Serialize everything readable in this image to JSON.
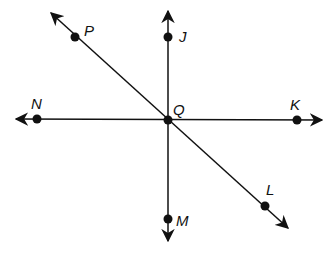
{
  "diagram": {
    "type": "geometry-lines",
    "center_point": "Q",
    "points": [
      {
        "label": "P",
        "x": 75,
        "y": 37
      },
      {
        "label": "J",
        "x": 168,
        "y": 37
      },
      {
        "label": "N",
        "x": 37,
        "y": 119
      },
      {
        "label": "Q",
        "x": 168,
        "y": 120
      },
      {
        "label": "K",
        "x": 297,
        "y": 120
      },
      {
        "label": "L",
        "x": 265,
        "y": 206
      },
      {
        "label": "M",
        "x": 168,
        "y": 219
      }
    ],
    "lines": [
      {
        "name": "line-NK",
        "through": [
          "N",
          "Q",
          "K"
        ]
      },
      {
        "name": "line-JM",
        "through": [
          "J",
          "Q",
          "M"
        ]
      },
      {
        "name": "line-PL",
        "through": [
          "P",
          "Q",
          "L"
        ]
      }
    ],
    "labels": {
      "P": "P",
      "J": "J",
      "N": "N",
      "Q": "Q",
      "K": "K",
      "L": "L",
      "M": "M"
    },
    "colors": {
      "stroke": "#111111",
      "background": "#ffffff"
    }
  }
}
